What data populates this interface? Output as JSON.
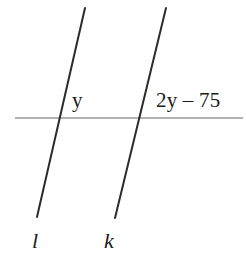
{
  "figure": {
    "type": "geometry-diagram",
    "background_color": "#ffffff",
    "transversal_color": "#2b2b2b",
    "horizontal_line_color": "#9a9a9a",
    "text_color": "#1a1a1a"
  },
  "angles": {
    "left": {
      "label": "y",
      "at_line": "l"
    },
    "right": {
      "label": "2y – 75",
      "at_line": "k"
    }
  },
  "lines": {
    "left": {
      "name": "l",
      "x1": 85,
      "y1": 8,
      "x2": 37,
      "y2": 217
    },
    "right": {
      "name": "k",
      "x1": 166,
      "y1": 8,
      "x2": 115,
      "y2": 218
    },
    "horizontal": {
      "name": "transversal",
      "x1": 15,
      "y1": 118,
      "x2": 243,
      "y2": 118
    }
  },
  "intersections": {
    "left": {
      "x": 59,
      "y": 118
    },
    "right": {
      "x": 140,
      "y": 118
    }
  }
}
